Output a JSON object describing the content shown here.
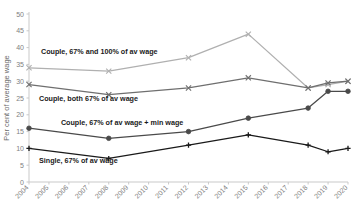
{
  "chart_data": {
    "type": "line",
    "title": "",
    "xlabel": "",
    "ylabel": "Per cent of average wage",
    "ylim": [
      0,
      50
    ],
    "ytick_labels": [
      "0",
      "5",
      "10",
      "15",
      "20",
      "25",
      "30",
      "35",
      "40",
      "45",
      "50"
    ],
    "ytick_values": [
      0,
      5,
      10,
      15,
      20,
      25,
      30,
      35,
      40,
      45,
      50
    ],
    "grid": false,
    "legend_position": "inline-annotations",
    "categories": [
      "2004",
      "2005",
      "2006",
      "2007",
      "2008",
      "2009",
      "2010",
      "2011",
      "2012",
      "2013",
      "2014",
      "2015",
      "2016",
      "2017",
      "2018",
      "2019",
      "2020"
    ],
    "series": [
      {
        "name": "Couple, 67% and 100% of av wage",
        "color": "#b0b0b0",
        "marker": "x-cross",
        "x": [
          2004,
          2008,
          2012,
          2015,
          2018,
          2019,
          2020
        ],
        "values": [
          34,
          33,
          37,
          44,
          28,
          29,
          30
        ]
      },
      {
        "name": "Couple, both 67% of av wage",
        "color": "#6f6f6f",
        "marker": "x-cross",
        "x": [
          2004,
          2008,
          2012,
          2015,
          2018,
          2019,
          2020
        ],
        "values": [
          29,
          26,
          28,
          31,
          28,
          29.5,
          30
        ]
      },
      {
        "name": "Couple, 67% of av wage + min wage",
        "color": "#4a4a4a",
        "marker": "circle",
        "x": [
          2004,
          2008,
          2012,
          2015,
          2018,
          2019,
          2020
        ],
        "values": [
          16,
          13,
          15,
          19,
          22,
          27,
          27
        ]
      },
      {
        "name": "Single, 67% of av wage",
        "color": "#1a1a1a",
        "marker": "plus-cross",
        "x": [
          2004,
          2008,
          2012,
          2015,
          2018,
          2019,
          2020
        ],
        "values": [
          10,
          7,
          11,
          14,
          11,
          9,
          10
        ]
      }
    ],
    "annotations": [
      {
        "text": "Couple, 67% and 100% of av wage",
        "x": 2004.6,
        "y": 38.2
      },
      {
        "text": "Couple, both 67% of av wage",
        "x": 2004.5,
        "y": 24.1
      },
      {
        "text": "Couple, 67% of av wage + min wage",
        "x": 2005.6,
        "y": 16.9
      },
      {
        "text": "Single, 67% of av wage",
        "x": 2004.5,
        "y": 5.6
      }
    ]
  }
}
